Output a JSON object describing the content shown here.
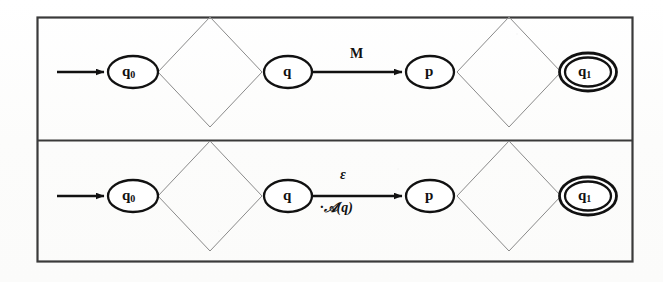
{
  "figure": {
    "background_color": "#fdfdfc",
    "ink_color": "#111111",
    "frame_color": "#3a3a3a",
    "thin_line_color": "#8a8a8a",
    "width": 663,
    "height": 282
  },
  "panels": [
    {
      "id": "top-panel",
      "name": "automaton-with-M-transition",
      "nodes": [
        {
          "id": "q0",
          "label": "q",
          "sub": "0",
          "kind": "start-state",
          "cx": 133,
          "cy": 72,
          "rx": 25,
          "ry": 16
        },
        {
          "id": "q",
          "label": "q",
          "sub": "",
          "kind": "state",
          "cx": 288,
          "cy": 72,
          "rx": 24,
          "ry": 16
        },
        {
          "id": "p",
          "label": "p",
          "sub": "",
          "kind": "state",
          "cx": 430,
          "cy": 72,
          "rx": 24,
          "ry": 16
        },
        {
          "id": "q1",
          "label": "q",
          "sub": "1",
          "kind": "accept-state",
          "cx": 588,
          "cy": 72,
          "rx": 25,
          "ry": 16
        }
      ],
      "diamonds": [
        {
          "id": "diamond-left",
          "cx": 210,
          "cy": 72,
          "hw": 52,
          "hh": 55
        },
        {
          "id": "diamond-right",
          "cx": 509,
          "cy": 72,
          "hw": 52,
          "hh": 55
        }
      ],
      "start_arrow": {
        "x1": 57,
        "y1": 72,
        "x2": 106,
        "y2": 72
      },
      "transition": {
        "id": "edge-q-to-p",
        "x1": 313,
        "y1": 72,
        "x2": 404,
        "y2": 72,
        "label_top": "M",
        "label_bottom": ""
      }
    },
    {
      "id": "bottom-panel",
      "name": "automaton-with-epsilon-transition",
      "nodes": [
        {
          "id": "q0",
          "label": "q",
          "sub": "0",
          "kind": "start-state",
          "cx": 133,
          "cy": 196,
          "rx": 25,
          "ry": 16
        },
        {
          "id": "q",
          "label": "q",
          "sub": "",
          "kind": "state",
          "cx": 288,
          "cy": 196,
          "rx": 24,
          "ry": 16
        },
        {
          "id": "p",
          "label": "p",
          "sub": "",
          "kind": "state",
          "cx": 430,
          "cy": 196,
          "rx": 24,
          "ry": 16
        },
        {
          "id": "q1",
          "label": "q",
          "sub": "1",
          "kind": "accept-state",
          "cx": 588,
          "cy": 196,
          "rx": 25,
          "ry": 16
        }
      ],
      "diamonds": [
        {
          "id": "diamond-left",
          "cx": 210,
          "cy": 196,
          "hw": 52,
          "hh": 55
        },
        {
          "id": "diamond-right",
          "cx": 509,
          "cy": 196,
          "hw": 52,
          "hh": 55
        }
      ],
      "start_arrow": {
        "x1": 57,
        "y1": 196,
        "x2": 106,
        "y2": 196
      },
      "transition": {
        "id": "edge-q-to-p",
        "x1": 313,
        "y1": 196,
        "x2": 404,
        "y2": 196,
        "label_top": "ε",
        "label_bottom": "·ᴀ𝒜(q)"
      }
    }
  ],
  "labels": {
    "q0": "q",
    "q0_sub": "0",
    "q": "q",
    "p": "p",
    "q1": "q",
    "q1_sub": "1",
    "edge_m": "M",
    "edge_epsilon": "ε",
    "edge_aq": "·𝒜(q)"
  },
  "frame": {
    "outer": {
      "x": 37,
      "y": 17,
      "width": 596,
      "height": 245
    },
    "divider_y": 140
  }
}
